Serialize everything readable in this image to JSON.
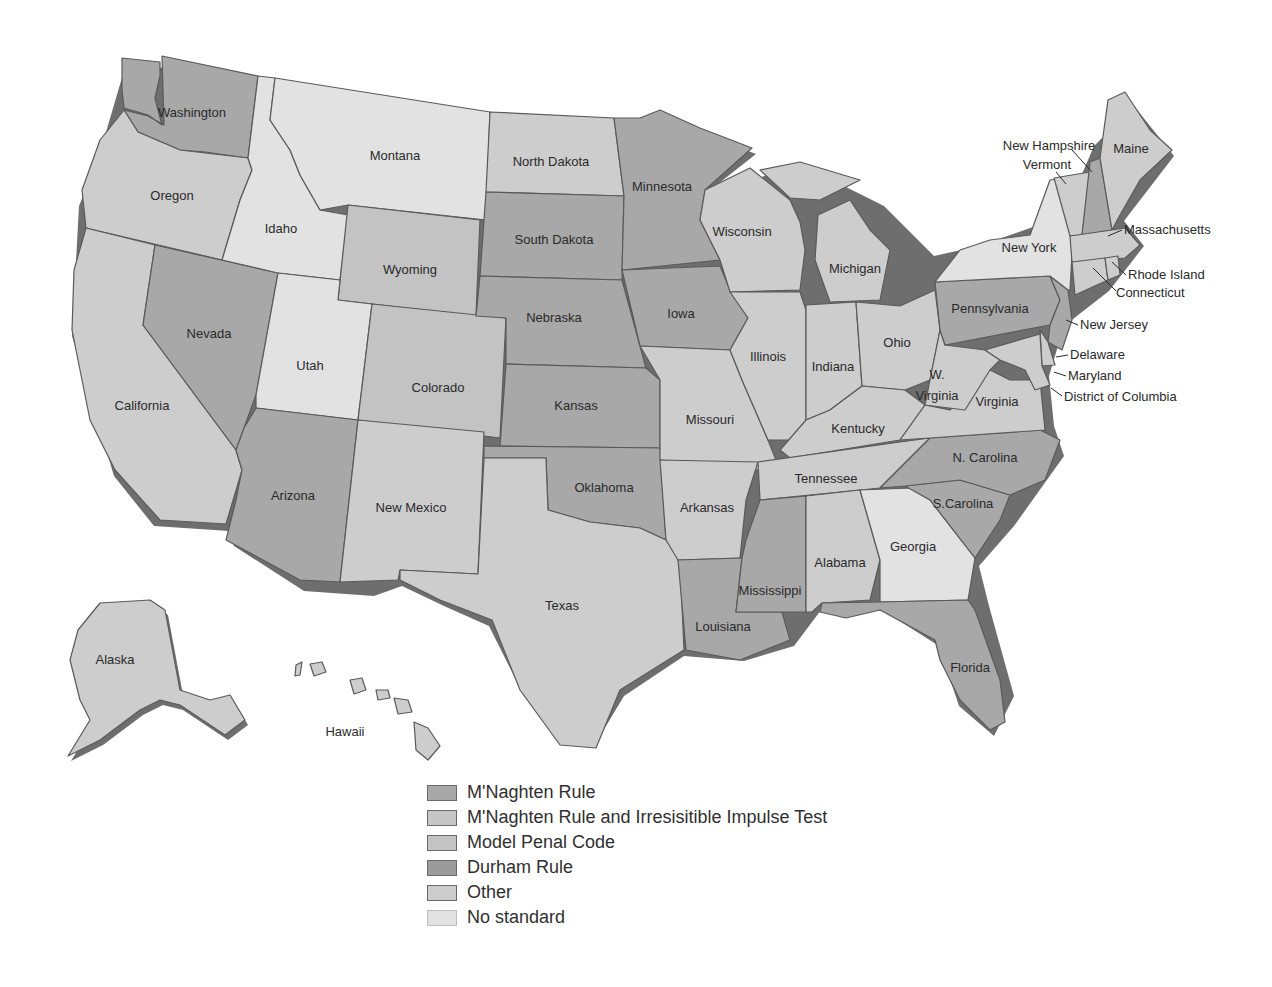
{
  "categories": {
    "mnaghten": {
      "label": "M'Naghten Rule",
      "color": "#a8a8a8"
    },
    "mnaghten_irresistible": {
      "label": "M'Naghten Rule and Irresisitible Impulse Test",
      "color": "#c6c6c6"
    },
    "model_penal_code": {
      "label": "Model Penal Code",
      "color": "#c3c3c3"
    },
    "durham": {
      "label": "Durham Rule",
      "color": "#9b9b9b"
    },
    "other": {
      "label": "Other",
      "color": "#cdcdcd"
    },
    "no_standard": {
      "label": "No standard",
      "color": "#e2e2e2"
    }
  },
  "legend": [
    {
      "key": "mnaghten",
      "label": "M'Naghten Rule",
      "color": "#a8a8a8"
    },
    {
      "key": "mnaghten_irresistible",
      "label": "M'Naghten Rule and Irresisitible Impulse Test",
      "color": "#c6c6c6"
    },
    {
      "key": "model_penal_code",
      "label": "Model Penal Code",
      "color": "#c3c3c3"
    },
    {
      "key": "durham",
      "label": "Durham Rule",
      "color": "#9b9b9b"
    },
    {
      "key": "other",
      "label": "Other",
      "color": "#cdcdcd"
    },
    {
      "key": "no_standard",
      "label": "No standard",
      "color": "#e2e2e2"
    }
  ],
  "states": {
    "washington": "Washington",
    "oregon": "Oregon",
    "california": "California",
    "idaho": "Idaho",
    "nevada": "Nevada",
    "montana": "Montana",
    "wyoming": "Wyoming",
    "utah": "Utah",
    "colorado": "Colorado",
    "arizona": "Arizona",
    "new_mexico": "New Mexico",
    "north_dakota": "North Dakota",
    "south_dakota": "South Dakota",
    "nebraska": "Nebraska",
    "kansas": "Kansas",
    "oklahoma": "Oklahoma",
    "texas": "Texas",
    "minnesota": "Minnesota",
    "iowa": "Iowa",
    "missouri": "Missouri",
    "arkansas": "Arkansas",
    "louisiana": "Louisiana",
    "wisconsin": "Wisconsin",
    "illinois": "Illinois",
    "michigan": "Michigan",
    "indiana": "Indiana",
    "ohio": "Ohio",
    "kentucky": "Kentucky",
    "tennessee": "Tennessee",
    "mississippi": "Mississippi",
    "alabama": "Alabama",
    "georgia": "Georgia",
    "florida": "Florida",
    "south_carolina": "S.Carolina",
    "north_carolina": "N. Carolina",
    "virginia": "Virginia",
    "west_virginia_1": "W.",
    "west_virginia_2": "Virginia",
    "pennsylvania": "Pennsylvania",
    "new_york": "New York",
    "new_jersey": "New Jersey",
    "delaware": "Delaware",
    "maryland": "Maryland",
    "dc": "District of Columbia",
    "connecticut": "Connecticut",
    "rhode_island": "Rhode Island",
    "massachusetts": "Massachusetts",
    "vermont": "Vermont",
    "new_hampshire": "New Hampshire",
    "maine": "Maine",
    "alaska": "Alaska",
    "hawaii": "Hawaii"
  }
}
